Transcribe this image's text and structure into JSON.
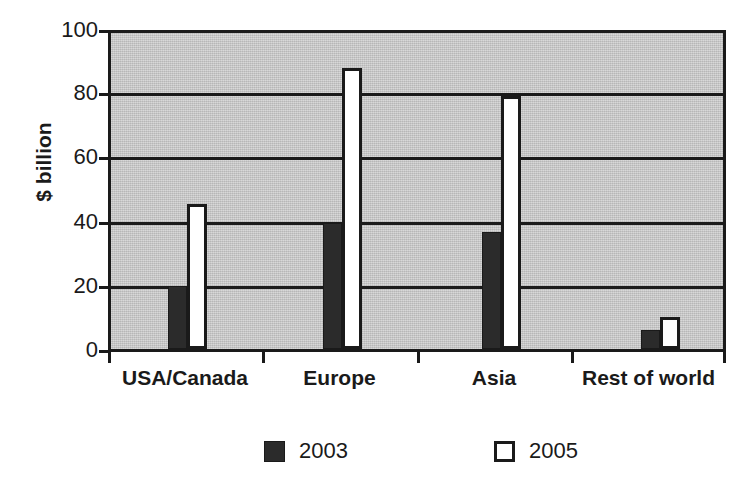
{
  "chart_data": {
    "type": "bar",
    "title": "",
    "xlabel": "",
    "ylabel": "$ billion",
    "categories": [
      "USA/Canada",
      "Europe",
      "Asia",
      "Rest of world"
    ],
    "series": [
      {
        "name": "2003",
        "color": "#2b2b2b",
        "style": "filled",
        "values": [
          20,
          40,
          37,
          6
        ]
      },
      {
        "name": "2005",
        "color": "#ffffff",
        "style": "hollow",
        "values": [
          46,
          89,
          80,
          10
        ]
      }
    ],
    "ylim": [
      0,
      100
    ],
    "yticks": [
      0,
      20,
      40,
      60,
      80,
      100
    ],
    "ytick_labels": [
      "0",
      "20",
      "40",
      "60",
      "80",
      "100"
    ],
    "grid": true,
    "grid_axis": "y",
    "legend_position": "bottom",
    "plot_background": "#c9c9c9",
    "axis_color": "#1a1a1a"
  },
  "legend": {
    "entries": [
      {
        "label": "2003",
        "swatch": "filled-square-icon"
      },
      {
        "label": "2005",
        "swatch": "hollow-square-icon"
      }
    ]
  }
}
